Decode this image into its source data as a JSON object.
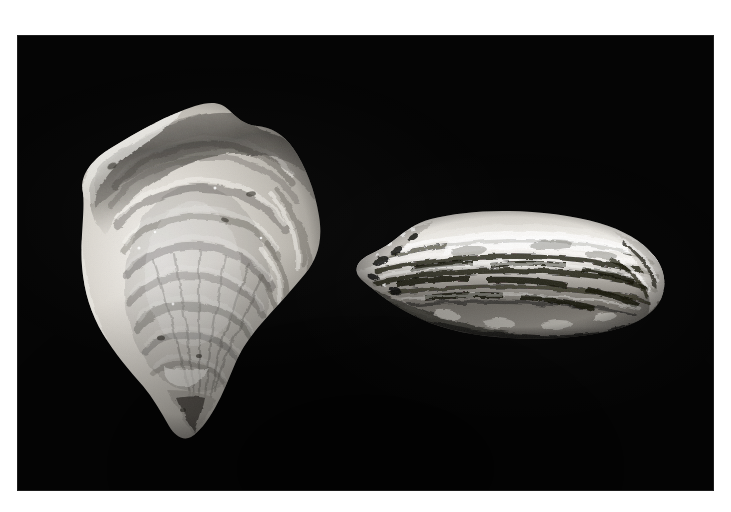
{
  "page": {
    "background_color": "#ffffff",
    "width": 731,
    "height": 512
  },
  "photo": {
    "name": "oyster-shell-photograph",
    "medium": "black-and-white photograph",
    "background_color": "#050505",
    "plate": {
      "x": 17,
      "y": 35,
      "width": 697,
      "height": 456
    },
    "margin_color": "#ffffff",
    "description": "Two oyster shells photographed against a plain black background: a large concave interior valve at left and a closed lateral edge view at right.",
    "subject_count": 2
  },
  "specimens": [
    {
      "id": "specimen-left",
      "label": "left-oyster-shell-interior-view",
      "view": "interior / concave valve, viewed face-on",
      "orientation": "vertical, hinge uppermost, umbo tip pointing down",
      "bounds": {
        "x": 65,
        "y": 98,
        "width": 275,
        "height": 342
      },
      "shape": "broad rounded fan tapering to a narrow beak at the lower left",
      "surface": "concentric growth ridges radiating from the umbo, chalky nacreous sheen",
      "tone_range": "mid grey to near-white with dark grey shadow band along the upper rim",
      "highlight_color": "#f2f0ec",
      "midtone_color": "#b4b0a9",
      "shadow_color": "#4a4743"
    },
    {
      "id": "specimen-right",
      "label": "right-oyster-shell-edge-view",
      "view": "lateral / edge-on, valves closed",
      "orientation": "horizontal, hinge at the left, bill end at the right",
      "bounds": {
        "x": 351,
        "y": 207,
        "width": 320,
        "height": 136
      },
      "shape": "elongated flattened oval, tapering and ragged at the left hinge",
      "surface": "stacked lamellar shell layers forming strong horizontal striations",
      "tone_range": "high contrast, bright white upper lamellae over deep black seam shadows",
      "highlight_color": "#fbfaf8",
      "midtone_color": "#9c9892",
      "shadow_color": "#16150f"
    }
  ]
}
